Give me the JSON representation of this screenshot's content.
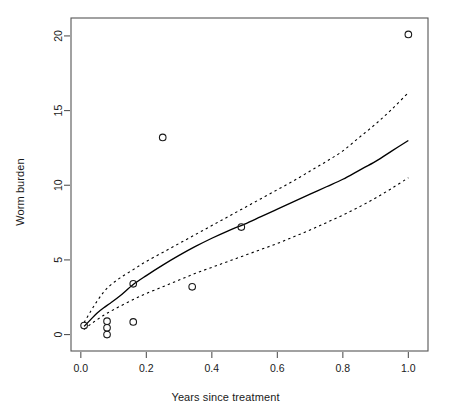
{
  "chart_data": {
    "type": "scatter",
    "title": "",
    "subtitle": "",
    "xlabel": "Years since treatment",
    "ylabel": "Worm burden",
    "xlim": [
      -0.03,
      1.06
    ],
    "ylim": [
      -1.1,
      21.2
    ],
    "xticks": [
      0.0,
      0.2,
      0.4,
      0.6,
      0.8,
      1.0
    ],
    "xticklabels": [
      "0.0",
      "0.2",
      "0.4",
      "0.6",
      "0.8",
      "1.0"
    ],
    "yticks": [
      0,
      5,
      10,
      15,
      20
    ],
    "yticklabels": [
      "0",
      "5",
      "10",
      "15",
      "20"
    ],
    "grid": false,
    "legend": null,
    "points": {
      "name": "Observed worm burden",
      "marker": "open-circle",
      "x": [
        0.01,
        0.08,
        0.08,
        0.08,
        0.16,
        0.16,
        0.25,
        0.34,
        0.49,
        1.0
      ],
      "y": [
        0.6,
        0.9,
        0.45,
        0.0,
        3.4,
        0.85,
        13.2,
        3.2,
        7.2,
        20.1
      ]
    },
    "series": [
      {
        "name": "Fitted curve",
        "style": "solid",
        "x": [
          0.01,
          0.03,
          0.05,
          0.07,
          0.09,
          0.12,
          0.16,
          0.2,
          0.25,
          0.3,
          0.35,
          0.4,
          0.45,
          0.5,
          0.55,
          0.6,
          0.65,
          0.7,
          0.75,
          0.8,
          0.85,
          0.9,
          0.95,
          1.0
        ],
        "y": [
          0.55,
          1.0,
          1.45,
          1.8,
          2.1,
          2.6,
          3.35,
          3.95,
          4.65,
          5.3,
          5.9,
          6.45,
          6.95,
          7.4,
          7.9,
          8.4,
          8.9,
          9.4,
          9.9,
          10.4,
          11.0,
          11.6,
          12.3,
          13.0
        ]
      },
      {
        "name": "Upper confidence bound",
        "style": "dashed",
        "x": [
          0.01,
          0.03,
          0.05,
          0.07,
          0.09,
          0.12,
          0.16,
          0.2,
          0.25,
          0.3,
          0.35,
          0.4,
          0.45,
          0.5,
          0.55,
          0.6,
          0.65,
          0.7,
          0.75,
          0.8,
          0.85,
          0.9,
          0.95,
          1.0
        ],
        "y": [
          0.8,
          1.55,
          2.25,
          2.85,
          3.3,
          3.8,
          4.35,
          4.9,
          5.5,
          6.1,
          6.7,
          7.3,
          7.9,
          8.5,
          9.1,
          9.7,
          10.3,
          10.95,
          11.6,
          12.3,
          13.2,
          14.1,
          15.1,
          16.2
        ]
      },
      {
        "name": "Lower confidence bound",
        "style": "dashed",
        "x": [
          0.01,
          0.03,
          0.05,
          0.07,
          0.09,
          0.12,
          0.16,
          0.2,
          0.25,
          0.3,
          0.35,
          0.4,
          0.45,
          0.5,
          0.55,
          0.6,
          0.65,
          0.7,
          0.75,
          0.8,
          0.85,
          0.9,
          0.95,
          1.0
        ],
        "y": [
          0.35,
          0.7,
          1.0,
          1.3,
          1.55,
          1.9,
          2.35,
          2.75,
          3.2,
          3.65,
          4.1,
          4.5,
          4.9,
          5.3,
          5.7,
          6.1,
          6.55,
          7.0,
          7.5,
          8.0,
          8.55,
          9.15,
          9.8,
          10.5
        ]
      }
    ],
    "colors": {
      "axis": "#555555",
      "point": "#1a1a1a",
      "fit_line": "#000000",
      "ci_line": "#000000",
      "background": "#ffffff"
    }
  }
}
